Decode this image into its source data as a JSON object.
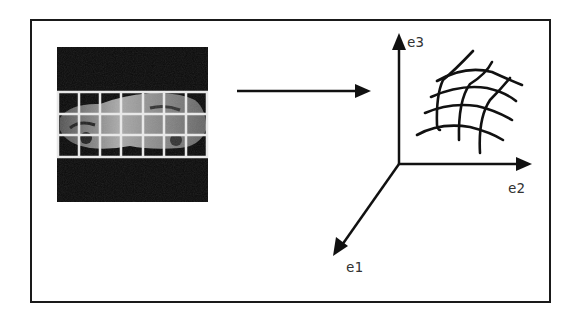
{
  "figure": {
    "input_image": {
      "grid_rows": 3,
      "grid_cols": 7
    },
    "axes": {
      "e1": "e1",
      "e2": "e2",
      "e3": "e3"
    },
    "colors": {
      "line": "#111111",
      "frame": "#1a1a1a",
      "image_bg": "#0a0a0a",
      "grid": "#e8e8e8"
    }
  }
}
